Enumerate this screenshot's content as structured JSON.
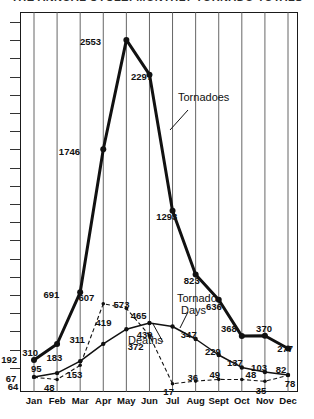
{
  "title": "THE ANNUAL CYCLE: MONTHLY TORNADO TOTALS",
  "chart_data": {
    "type": "line",
    "title": "THE ANNUAL CYCLE: MONTHLY TORNADO TOTALS",
    "xlabel": "",
    "ylabel": "",
    "grid": "vertical gridlines at each month; unlabeled y-axis ticks on left spine",
    "legend": "inline annotations on curves",
    "ylim": [
      0,
      2700
    ],
    "categories": [
      "Jan",
      "Feb",
      "Mar",
      "Apr",
      "May",
      "Jun",
      "Jul",
      "Aug",
      "Sept",
      "Oct",
      "Nov",
      "Dec"
    ],
    "series": [
      {
        "name": "Tornadoes",
        "style": "thick-solid-with-markers",
        "values": [
          192,
          310,
          691,
          1746,
          2553,
          2297,
          1293,
          823,
          636,
          368,
          370,
          277
        ]
      },
      {
        "name": "Tornado Days",
        "style": "thin-solid-with-markers",
        "values": [
          67,
          95,
          183,
          311,
          419,
          465,
          439,
          347,
          229,
          137,
          103,
          82
        ]
      },
      {
        "name": "Deaths",
        "style": "dashed-with-markers",
        "values": [
          64,
          48,
          153,
          607,
          573,
          372,
          17,
          36,
          49,
          48,
          35,
          78
        ]
      }
    ],
    "annotations": [
      {
        "text": "Tornadoes",
        "points_to": "Tornadoes curve between Jun and Jul"
      },
      {
        "text": "Tornado",
        "points_to": "Tornado Days curve near Jul"
      },
      {
        "text": "Days",
        "points_to": "Tornado Days curve near Jul"
      },
      {
        "text": "Deaths",
        "points_to": "Deaths dashed curve near Jun-Jul"
      }
    ]
  },
  "axis": {
    "months": [
      "Jan",
      "Feb",
      "Mar",
      "Apr",
      "May",
      "Jun",
      "Jul",
      "Aug",
      "Sept",
      "Oct",
      "Nov",
      "Dec"
    ]
  },
  "annotations": {
    "tornadoes": "Tornadoes",
    "tornado": "Tornado",
    "days": "Days",
    "deaths": "Deaths"
  },
  "colors": {
    "ink": "#111111",
    "frame": "#1a1a1a",
    "grid": "#555555",
    "background": "#ffffff"
  }
}
